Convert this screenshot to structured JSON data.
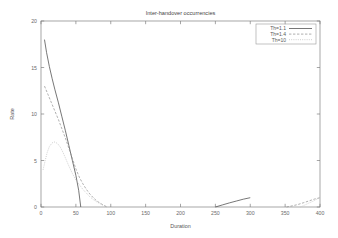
{
  "chart_data": {
    "type": "line",
    "title": "Inter-handover occurrencies",
    "xlabel": "Duration",
    "ylabel": "Rate",
    "xlim": [
      0,
      400
    ],
    "ylim": [
      0,
      20
    ],
    "xticks": [
      0,
      50,
      100,
      150,
      200,
      250,
      300,
      350,
      400
    ],
    "yticks": [
      0,
      5,
      10,
      15,
      20
    ],
    "grid": false,
    "legend_position": "top-right",
    "series": [
      {
        "name": "Th=1.1",
        "style": "solid",
        "color": "#4a4a4a",
        "points": [
          [
            5,
            18.0
          ],
          [
            8,
            16.6
          ],
          [
            12,
            15.1
          ],
          [
            16,
            13.8
          ],
          [
            20,
            12.6
          ],
          [
            25,
            11.2
          ],
          [
            30,
            9.7
          ],
          [
            35,
            8.2
          ],
          [
            40,
            6.6
          ],
          [
            45,
            5.0
          ],
          [
            50,
            3.4
          ],
          [
            54,
            1.8
          ],
          [
            57,
            0.0
          ]
        ],
        "points_tail": [
          [
            250,
            0.0
          ],
          [
            260,
            0.22
          ],
          [
            270,
            0.44
          ],
          [
            280,
            0.64
          ],
          [
            290,
            0.84
          ],
          [
            300,
            1.0
          ]
        ]
      },
      {
        "name": "Th=1.4",
        "style": "dashed",
        "color": "#8d8d8d",
        "points": [
          [
            5,
            13.0
          ],
          [
            10,
            12.1
          ],
          [
            15,
            11.2
          ],
          [
            20,
            10.3
          ],
          [
            25,
            9.4
          ],
          [
            30,
            8.4
          ],
          [
            35,
            7.4
          ],
          [
            40,
            6.3
          ],
          [
            45,
            5.2
          ],
          [
            50,
            4.1
          ],
          [
            55,
            3.2
          ],
          [
            60,
            2.5
          ],
          [
            65,
            1.9
          ],
          [
            70,
            1.4
          ],
          [
            75,
            1.0
          ],
          [
            80,
            0.65
          ],
          [
            85,
            0.4
          ],
          [
            90,
            0.18
          ],
          [
            95,
            0.0
          ]
        ],
        "points_tail": [
          [
            352,
            0.0
          ],
          [
            360,
            0.12
          ],
          [
            368,
            0.26
          ],
          [
            376,
            0.45
          ],
          [
            384,
            0.65
          ],
          [
            392,
            0.85
          ],
          [
            400,
            1.0
          ]
        ]
      },
      {
        "name": "Th=10",
        "style": "dotted",
        "color": "#c2c2c2",
        "points": [
          [
            3,
            4.0
          ],
          [
            6,
            5.0
          ],
          [
            9,
            5.9
          ],
          [
            12,
            6.5
          ],
          [
            16,
            6.9
          ],
          [
            20,
            7.0
          ],
          [
            24,
            6.8
          ],
          [
            28,
            6.4
          ],
          [
            32,
            5.8
          ],
          [
            36,
            5.1
          ],
          [
            40,
            4.4
          ],
          [
            45,
            3.6
          ],
          [
            50,
            2.9
          ],
          [
            55,
            2.4
          ],
          [
            60,
            1.9
          ],
          [
            65,
            1.5
          ],
          [
            70,
            1.1
          ],
          [
            75,
            0.8
          ],
          [
            80,
            0.55
          ],
          [
            85,
            0.35
          ],
          [
            90,
            0.15
          ],
          [
            95,
            0.0
          ]
        ],
        "points_tail": [
          [
            372,
            0.0
          ],
          [
            378,
            0.2
          ],
          [
            384,
            0.42
          ],
          [
            390,
            0.62
          ],
          [
            395,
            0.82
          ],
          [
            400,
            1.0
          ]
        ]
      }
    ]
  }
}
